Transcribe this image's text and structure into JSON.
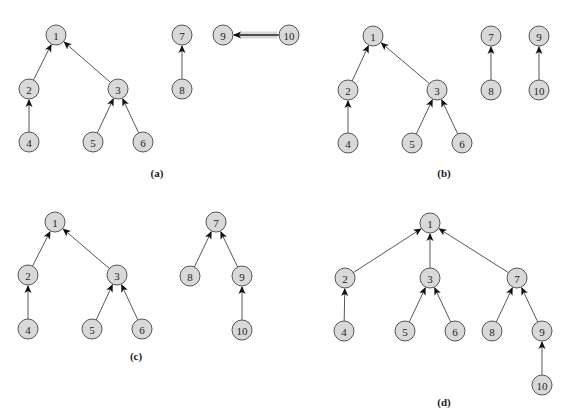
{
  "diagram": {
    "style": {
      "node_fill": "#d9d9d9",
      "node_stroke": "#555555",
      "edge_color": "#444444",
      "highlight_color": "#d8d8d8",
      "node_radius": 10
    },
    "panels": [
      {
        "id": "a",
        "label": "(a)",
        "label_pos": [
          157,
          177
        ],
        "nodes": [
          {
            "id": "1",
            "label": "1",
            "x": 56,
            "y": 35
          },
          {
            "id": "2",
            "label": "2",
            "x": 29,
            "y": 89
          },
          {
            "id": "3",
            "label": "3",
            "x": 118,
            "y": 89
          },
          {
            "id": "4",
            "label": "4",
            "x": 29,
            "y": 142
          },
          {
            "id": "5",
            "label": "5",
            "x": 93,
            "y": 142
          },
          {
            "id": "6",
            "label": "6",
            "x": 143,
            "y": 142
          },
          {
            "id": "7",
            "label": "7",
            "x": 182,
            "y": 35
          },
          {
            "id": "8",
            "label": "8",
            "x": 182,
            "y": 89
          },
          {
            "id": "9",
            "label": "9",
            "x": 223,
            "y": 35
          },
          {
            "id": "10",
            "label": "10",
            "x": 289,
            "y": 35
          }
        ],
        "edges": [
          {
            "from": "2",
            "to": "1"
          },
          {
            "from": "3",
            "to": "1"
          },
          {
            "from": "4",
            "to": "2"
          },
          {
            "from": "5",
            "to": "3"
          },
          {
            "from": "6",
            "to": "3"
          },
          {
            "from": "8",
            "to": "7"
          },
          {
            "from": "10",
            "to": "9",
            "highlighted": true
          }
        ]
      },
      {
        "id": "b",
        "label": "(b)",
        "label_pos": [
          444,
          177
        ],
        "nodes": [
          {
            "id": "1",
            "label": "1",
            "x": 373,
            "y": 36
          },
          {
            "id": "2",
            "label": "2",
            "x": 348,
            "y": 90
          },
          {
            "id": "3",
            "label": "3",
            "x": 437,
            "y": 90
          },
          {
            "id": "4",
            "label": "4",
            "x": 348,
            "y": 143
          },
          {
            "id": "5",
            "label": "5",
            "x": 412,
            "y": 143
          },
          {
            "id": "6",
            "label": "6",
            "x": 462,
            "y": 143
          },
          {
            "id": "7",
            "label": "7",
            "x": 491,
            "y": 36
          },
          {
            "id": "8",
            "label": "8",
            "x": 491,
            "y": 90
          },
          {
            "id": "9",
            "label": "9",
            "x": 539,
            "y": 36
          },
          {
            "id": "10",
            "label": "10",
            "x": 539,
            "y": 90
          }
        ],
        "edges": [
          {
            "from": "2",
            "to": "1"
          },
          {
            "from": "3",
            "to": "1"
          },
          {
            "from": "4",
            "to": "2"
          },
          {
            "from": "5",
            "to": "3"
          },
          {
            "from": "6",
            "to": "3"
          },
          {
            "from": "8",
            "to": "7"
          },
          {
            "from": "10",
            "to": "9"
          }
        ]
      },
      {
        "id": "c",
        "label": "(c)",
        "label_pos": [
          136,
          360
        ],
        "nodes": [
          {
            "id": "1",
            "label": "1",
            "x": 55,
            "y": 222
          },
          {
            "id": "2",
            "label": "2",
            "x": 28,
            "y": 275
          },
          {
            "id": "3",
            "label": "3",
            "x": 117,
            "y": 275
          },
          {
            "id": "4",
            "label": "4",
            "x": 28,
            "y": 329
          },
          {
            "id": "5",
            "label": "5",
            "x": 92,
            "y": 329
          },
          {
            "id": "6",
            "label": "6",
            "x": 142,
            "y": 329
          },
          {
            "id": "7",
            "label": "7",
            "x": 216,
            "y": 222
          },
          {
            "id": "8",
            "label": "8",
            "x": 190,
            "y": 276
          },
          {
            "id": "9",
            "label": "9",
            "x": 242,
            "y": 276
          },
          {
            "id": "10",
            "label": "10",
            "x": 242,
            "y": 330
          }
        ],
        "edges": [
          {
            "from": "2",
            "to": "1"
          },
          {
            "from": "3",
            "to": "1"
          },
          {
            "from": "4",
            "to": "2"
          },
          {
            "from": "5",
            "to": "3"
          },
          {
            "from": "6",
            "to": "3"
          },
          {
            "from": "8",
            "to": "7"
          },
          {
            "from": "9",
            "to": "7"
          },
          {
            "from": "10",
            "to": "9"
          }
        ]
      },
      {
        "id": "d",
        "label": "(d)",
        "label_pos": [
          444,
          406
        ],
        "nodes": [
          {
            "id": "1",
            "label": "1",
            "x": 430,
            "y": 223
          },
          {
            "id": "2",
            "label": "2",
            "x": 345,
            "y": 278
          },
          {
            "id": "3",
            "label": "3",
            "x": 430,
            "y": 278
          },
          {
            "id": "4",
            "label": "4",
            "x": 344,
            "y": 331
          },
          {
            "id": "5",
            "label": "5",
            "x": 405,
            "y": 331
          },
          {
            "id": "6",
            "label": "6",
            "x": 455,
            "y": 331
          },
          {
            "id": "7",
            "label": "7",
            "x": 517,
            "y": 278
          },
          {
            "id": "8",
            "label": "8",
            "x": 492,
            "y": 331
          },
          {
            "id": "9",
            "label": "9",
            "x": 542,
            "y": 331
          },
          {
            "id": "10",
            "label": "10",
            "x": 542,
            "y": 385
          }
        ],
        "edges": [
          {
            "from": "2",
            "to": "1"
          },
          {
            "from": "3",
            "to": "1"
          },
          {
            "from": "7",
            "to": "1"
          },
          {
            "from": "4",
            "to": "2"
          },
          {
            "from": "5",
            "to": "3"
          },
          {
            "from": "6",
            "to": "3"
          },
          {
            "from": "8",
            "to": "7"
          },
          {
            "from": "9",
            "to": "7"
          },
          {
            "from": "10",
            "to": "9"
          }
        ]
      }
    ]
  }
}
